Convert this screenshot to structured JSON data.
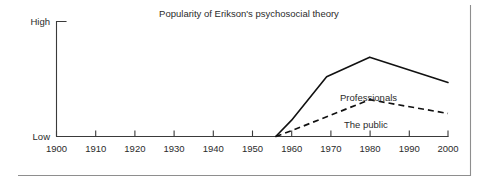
{
  "chart_data": {
    "type": "line",
    "title": "Popularity of Erikson's psychosocial theory",
    "xlabel": "",
    "ylabel": "",
    "xlim": [
      1900,
      2000
    ],
    "ylim": [
      0,
      100
    ],
    "grid": false,
    "legend_position": "inline-labels",
    "x_tick_labels": [
      "1900",
      "1910",
      "1920",
      "1930",
      "1940",
      "1950",
      "1960",
      "1970",
      "1980",
      "1990",
      "2000"
    ],
    "x_ticks": [
      1900,
      1910,
      1920,
      1930,
      1940,
      1950,
      1960,
      1970,
      1980,
      1990,
      2000
    ],
    "y_tick_labels": [
      "High",
      "Low"
    ],
    "y_axis_high_label": "High",
    "y_axis_low_label": "Low",
    "series": [
      {
        "name": "Professionals",
        "style": "solid",
        "x": [
          1956,
          1960,
          1969,
          1980,
          2000
        ],
        "values": [
          0,
          14,
          52,
          69,
          47
        ]
      },
      {
        "name": "The public",
        "style": "dashed",
        "x": [
          1956,
          1960,
          1980,
          2000
        ],
        "values": [
          0,
          5,
          32,
          20
        ]
      }
    ],
    "annotations": [
      {
        "text": "Professionals",
        "x": 1972,
        "y": 45
      },
      {
        "text": "The public",
        "x": 1974,
        "y": 22
      }
    ]
  },
  "figure": {
    "title": "Popularity of Erikson's psychosocial theory",
    "axis": {
      "high_label": "High",
      "low_label": "Low"
    },
    "x_tick_labels": [
      "1900",
      "1910",
      "1920",
      "1930",
      "1940",
      "1950",
      "1960",
      "1970",
      "1980",
      "1990",
      "2000"
    ],
    "series_labels": {
      "professionals": "Professionals",
      "public": "The public"
    },
    "colors": {
      "line": "#111111",
      "axis": "#3a3a3a",
      "text": "#2b2b2b",
      "frame": "#8e8e8e",
      "background": "#ffffff"
    }
  }
}
